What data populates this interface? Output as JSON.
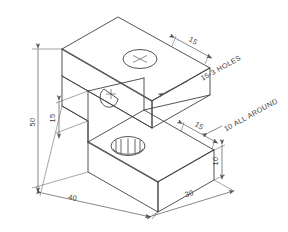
{
  "drawing": {
    "title": "Isometric view of stepped block",
    "background_color": "#ffffff",
    "line_color": "#3f3f3f",
    "dimension_color": "#555555",
    "text_color": "#3a3a3a",
    "projection": "isometric"
  },
  "dimensions": [
    {
      "id": "overall-height",
      "value": "50",
      "position": "left",
      "orientation": "vertical",
      "description": "Overall height of block, left side"
    },
    {
      "id": "step-height",
      "value": "15",
      "position": "left-inner",
      "orientation": "vertical",
      "description": "Height of notch / step measured from upper slab underside"
    },
    {
      "id": "overall-length",
      "value": "40",
      "position": "bottom-left",
      "orientation": "iso-left",
      "description": "Overall length along lower-left base edge"
    },
    {
      "id": "overall-width",
      "value": "30",
      "position": "bottom-right",
      "orientation": "iso-right",
      "description": "Overall width along lower-right base edge"
    },
    {
      "id": "top-edge-offset",
      "value": "15",
      "position": "top-right",
      "orientation": "iso-right",
      "description": "Offset of hole centre from top rear edge"
    },
    {
      "id": "lower-edge-offset",
      "value": "15",
      "position": "right-middle",
      "orientation": "iso-right",
      "description": "Offset of lower hole centre from right edge"
    },
    {
      "id": "right-face-height",
      "value": "10",
      "position": "right",
      "orientation": "vertical",
      "description": "Thickness of lower slab at right face"
    }
  ],
  "notes": [
    {
      "id": "hole-callout",
      "text": "15-3 HOLES",
      "leader": true,
      "description": "Diameter 15 holes, three places"
    },
    {
      "id": "fillet-callout",
      "text": "10 ALL AROUND",
      "leader": true,
      "description": "Radius 10 fillet all around"
    }
  ],
  "features": [
    {
      "id": "hole-top-face",
      "type": "circular-hole",
      "face": "top",
      "diameter": "15",
      "has_centre_mark": true
    },
    {
      "id": "hole-vertical-face",
      "type": "circular-hole",
      "face": "vertical-back",
      "diameter": "15",
      "has_centre_mark": true
    },
    {
      "id": "hole-lower-face",
      "type": "circular-hole",
      "face": "lower-top",
      "diameter": "15",
      "has_centre_mark": true,
      "shows_depth": true
    }
  ]
}
